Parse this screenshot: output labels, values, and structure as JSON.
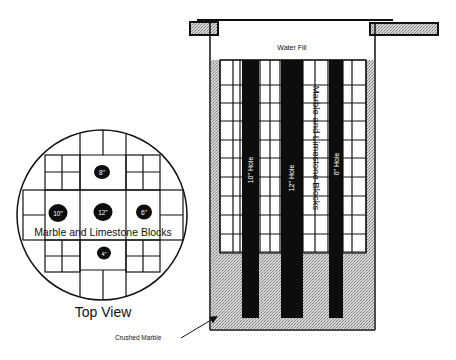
{
  "diagram": {
    "type": "engineering-schematic",
    "colors": {
      "line": "#111111",
      "hole_fill": "#0d0d0d",
      "stipple": "#b8b8b8",
      "background": "#ffffff"
    },
    "top_view": {
      "title": "Top View",
      "overlay_label": "Marble and Limestone Blocks",
      "holes": [
        {
          "label": "8\"",
          "position": "top"
        },
        {
          "label": "10\"",
          "position": "left"
        },
        {
          "label": "12\"",
          "position": "center"
        },
        {
          "label": "6\"",
          "position": "right"
        },
        {
          "label": "4\"",
          "position": "bottom"
        }
      ]
    },
    "side_view": {
      "top_label": "Water Fill",
      "vertical_block_label": "Marble and Limestone Blocks",
      "holes": [
        {
          "label": "10\" Hole"
        },
        {
          "label": "12\" Hole"
        },
        {
          "label": "6\" Hole"
        }
      ],
      "callout": "Crushed Marble"
    }
  }
}
